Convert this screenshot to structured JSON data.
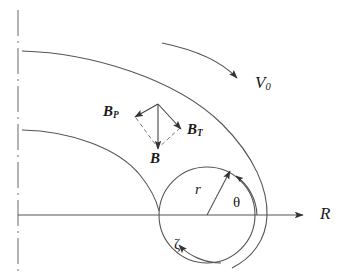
{
  "figure": {
    "background_color": "#ffffff",
    "line_color": "#555555",
    "label_color": "#1a1a1a"
  },
  "axes": {
    "horizontal": {
      "name": "R-axis",
      "label": "R",
      "arrow": "right-arrow",
      "y": 215,
      "x_start": 18,
      "x_end": 312
    },
    "vertical": {
      "name": "symmetry-axis",
      "label": "",
      "style": "dash-dot",
      "x": 18,
      "y_start": 10,
      "y_end": 272
    }
  },
  "labels": {
    "v0": "V",
    "v0_sub": "0",
    "bp": "B",
    "bp_sub": "P",
    "bt": "B",
    "bt_sub": "T",
    "b": "B",
    "r": "r",
    "theta": "θ",
    "zeta": "ζ",
    "R": "R"
  },
  "elements": {
    "outer_flux_curve": "outer-field-line",
    "inner_flux_curve": "inner-field-line",
    "circle": "flux-tube-cross-section",
    "flow_arrow": "v0-flow-arrow",
    "radius_arrow": "r-radius-arrow",
    "theta_arc": "theta-angle-arc",
    "zeta_arc": "zeta-angle-arc",
    "vector_b": "b-total-vector",
    "vector_bp": "bp-poloidal-vector",
    "vector_bt": "bt-toroidal-vector",
    "parallelogram": "vector-decomposition-dashed"
  },
  "geometry": {
    "circle_center_x": 207,
    "circle_center_y": 215,
    "circle_radius": 48,
    "vector_apex_x": 158,
    "vector_apex_y": 104
  }
}
